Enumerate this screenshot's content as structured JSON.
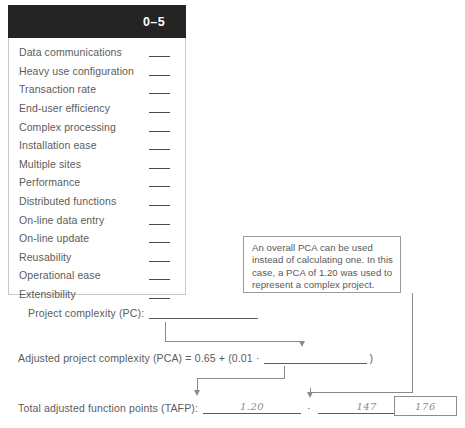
{
  "factors_table": {
    "scale_header": "0–5",
    "rows": [
      {
        "label": "Data communications",
        "value": ""
      },
      {
        "label": "Heavy use configuration",
        "value": ""
      },
      {
        "label": "Transaction rate",
        "value": ""
      },
      {
        "label": "End-user efficiency",
        "value": ""
      },
      {
        "label": "Complex processing",
        "value": ""
      },
      {
        "label": "Installation ease",
        "value": ""
      },
      {
        "label": "Multiple sites",
        "value": ""
      },
      {
        "label": "Performance",
        "value": ""
      },
      {
        "label": "Distributed functions",
        "value": ""
      },
      {
        "label": "On-line data entry",
        "value": ""
      },
      {
        "label": "On-line update",
        "value": ""
      },
      {
        "label": "Reusability",
        "value": ""
      },
      {
        "label": "Operational ease",
        "value": ""
      },
      {
        "label": "Extensibility",
        "value": ""
      }
    ]
  },
  "callout": {
    "text": "An overall PCA can be used instead of calculating one. In this case, a PCA of 1.20 was used to represent a complex project."
  },
  "form": {
    "pc_label": "Project complexity (PC):",
    "pc_value": "",
    "pca_label": "Adjusted project complexity (PCA) = 0.65 + (0.01 ·",
    "pca_value": "",
    "pca_tail": ")",
    "tafp_label": "Total adjusted function points (TAFP):",
    "tafp_factor1": "1.20",
    "tafp_operator": "·",
    "tafp_factor2": "147",
    "tafp_equals": "=",
    "tafp_result": "176"
  },
  "colors": {
    "header_bg": "#242424",
    "header_text": "#ffffff",
    "body_text": "#5c5c5c",
    "rule": "#8a8a8a",
    "handwriting": "#8b8b8b"
  }
}
